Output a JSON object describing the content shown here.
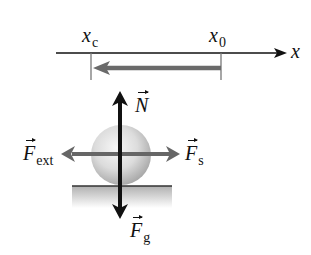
{
  "diagram": {
    "axis": {
      "label": "x",
      "ticks": [
        {
          "id": "xc",
          "base": "x",
          "sub": "c"
        },
        {
          "id": "x0",
          "base": "x",
          "sub": "0"
        }
      ],
      "displacement_direction": "from x0 to xc (leftward)"
    },
    "forces": [
      {
        "id": "normal",
        "base": "N",
        "sub": "",
        "direction": "up",
        "color": "#111111"
      },
      {
        "id": "gravity",
        "base": "F",
        "sub": "g",
        "direction": "down",
        "color": "#111111"
      },
      {
        "id": "spring",
        "base": "F",
        "sub": "s",
        "direction": "right",
        "color": "#666666"
      },
      {
        "id": "external",
        "base": "F",
        "sub": "ext",
        "direction": "left",
        "color": "#666666"
      }
    ],
    "colors": {
      "axis": "#111111",
      "displacement_arrow": "#6a6a6a",
      "vertical_forces": "#111111",
      "horizontal_forces": "#666666",
      "ground_shade": "#bdbdbd",
      "sphere_light": "#f4f4f4",
      "sphere_dark": "#a8a8a8"
    }
  }
}
